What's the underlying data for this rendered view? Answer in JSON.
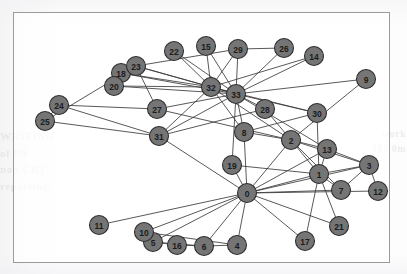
{
  "figure": {
    "frame": {
      "border_color": "#9a9a9a",
      "background_color": "#ffffff"
    },
    "node_style": {
      "fill_color": "#757575",
      "stroke_color": "#2f2f2f",
      "label_color": "#1c1c1c",
      "radius": 9.5
    },
    "edge_style": {
      "color": "#3b3b3b",
      "width": 0.85
    }
  },
  "background_bleed": {
    "left_text": "WRITING\nof EV\nnon CBT\nreporting",
    "right_text": "work\n180 0m"
  },
  "chart_data": {
    "type": "graph",
    "xlabel": "",
    "ylabel": "",
    "directed": false,
    "node_count": 34,
    "edge_count": 78,
    "layout": "spring",
    "nodes": [
      {
        "id": "0",
        "label": "0",
        "x": 233,
        "y": 180
      },
      {
        "id": "1",
        "label": "1",
        "x": 305,
        "y": 161
      },
      {
        "id": "2",
        "label": "2",
        "x": 277,
        "y": 127
      },
      {
        "id": "3",
        "label": "3",
        "x": 355,
        "y": 152
      },
      {
        "id": "4",
        "label": "4",
        "x": 223,
        "y": 232
      },
      {
        "id": "5",
        "label": "5",
        "x": 139,
        "y": 229
      },
      {
        "id": "6",
        "label": "6",
        "x": 190,
        "y": 233
      },
      {
        "id": "7",
        "label": "7",
        "x": 327,
        "y": 177
      },
      {
        "id": "8",
        "label": "8",
        "x": 230,
        "y": 119
      },
      {
        "id": "9",
        "label": "9",
        "x": 352,
        "y": 66
      },
      {
        "id": "10",
        "label": "10",
        "x": 130,
        "y": 219
      },
      {
        "id": "11",
        "label": "11",
        "x": 85,
        "y": 212
      },
      {
        "id": "12",
        "label": "12",
        "x": 364,
        "y": 178
      },
      {
        "id": "13",
        "label": "13",
        "x": 313,
        "y": 136
      },
      {
        "id": "14",
        "label": "14",
        "x": 300,
        "y": 43
      },
      {
        "id": "15",
        "label": "15",
        "x": 192,
        "y": 33
      },
      {
        "id": "16",
        "label": "16",
        "x": 163,
        "y": 232
      },
      {
        "id": "17",
        "label": "17",
        "x": 291,
        "y": 228
      },
      {
        "id": "18",
        "label": "18",
        "x": 107,
        "y": 60
      },
      {
        "id": "19",
        "label": "19",
        "x": 218,
        "y": 152
      },
      {
        "id": "20",
        "label": "20",
        "x": 100,
        "y": 73
      },
      {
        "id": "21",
        "label": "21",
        "x": 325,
        "y": 213
      },
      {
        "id": "22",
        "label": "22",
        "x": 160,
        "y": 38
      },
      {
        "id": "23",
        "label": "23",
        "x": 122,
        "y": 53
      },
      {
        "id": "24",
        "label": "24",
        "x": 45,
        "y": 92
      },
      {
        "id": "25",
        "label": "25",
        "x": 31,
        "y": 108
      },
      {
        "id": "26",
        "label": "26",
        "x": 270,
        "y": 35
      },
      {
        "id": "27",
        "label": "27",
        "x": 143,
        "y": 96
      },
      {
        "id": "28",
        "label": "28",
        "x": 251,
        "y": 96
      },
      {
        "id": "29",
        "label": "29",
        "x": 224,
        "y": 36
      },
      {
        "id": "30",
        "label": "30",
        "x": 303,
        "y": 100
      },
      {
        "id": "31",
        "label": "31",
        "x": 145,
        "y": 123
      },
      {
        "id": "32",
        "label": "32",
        "x": 197,
        "y": 74
      },
      {
        "id": "33",
        "label": "33",
        "x": 222,
        "y": 81
      }
    ],
    "edges": [
      [
        "0",
        "1"
      ],
      [
        "0",
        "2"
      ],
      [
        "0",
        "3"
      ],
      [
        "0",
        "4"
      ],
      [
        "0",
        "5"
      ],
      [
        "0",
        "6"
      ],
      [
        "0",
        "7"
      ],
      [
        "0",
        "8"
      ],
      [
        "0",
        "10"
      ],
      [
        "0",
        "11"
      ],
      [
        "0",
        "12"
      ],
      [
        "0",
        "13"
      ],
      [
        "0",
        "17"
      ],
      [
        "0",
        "19"
      ],
      [
        "0",
        "21"
      ],
      [
        "0",
        "31"
      ],
      [
        "1",
        "2"
      ],
      [
        "1",
        "3"
      ],
      [
        "1",
        "7"
      ],
      [
        "1",
        "13"
      ],
      [
        "1",
        "17"
      ],
      [
        "1",
        "19"
      ],
      [
        "1",
        "21"
      ],
      [
        "1",
        "30"
      ],
      [
        "2",
        "3"
      ],
      [
        "2",
        "7"
      ],
      [
        "2",
        "8"
      ],
      [
        "2",
        "9"
      ],
      [
        "2",
        "13"
      ],
      [
        "2",
        "27"
      ],
      [
        "2",
        "28"
      ],
      [
        "2",
        "32"
      ],
      [
        "3",
        "7"
      ],
      [
        "3",
        "12"
      ],
      [
        "3",
        "13"
      ],
      [
        "4",
        "6"
      ],
      [
        "4",
        "10"
      ],
      [
        "5",
        "6"
      ],
      [
        "5",
        "10"
      ],
      [
        "5",
        "16"
      ],
      [
        "6",
        "16"
      ],
      [
        "8",
        "30"
      ],
      [
        "8",
        "32"
      ],
      [
        "8",
        "33"
      ],
      [
        "9",
        "33"
      ],
      [
        "13",
        "33"
      ],
      [
        "14",
        "32"
      ],
      [
        "14",
        "33"
      ],
      [
        "15",
        "32"
      ],
      [
        "15",
        "33"
      ],
      [
        "18",
        "32"
      ],
      [
        "18",
        "33"
      ],
      [
        "19",
        "33"
      ],
      [
        "20",
        "32"
      ],
      [
        "20",
        "33"
      ],
      [
        "22",
        "32"
      ],
      [
        "22",
        "33"
      ],
      [
        "23",
        "25"
      ],
      [
        "23",
        "27"
      ],
      [
        "23",
        "29"
      ],
      [
        "23",
        "32"
      ],
      [
        "23",
        "33"
      ],
      [
        "24",
        "25"
      ],
      [
        "24",
        "27"
      ],
      [
        "24",
        "31"
      ],
      [
        "25",
        "31"
      ],
      [
        "26",
        "29"
      ],
      [
        "26",
        "33"
      ],
      [
        "27",
        "33"
      ],
      [
        "28",
        "31"
      ],
      [
        "28",
        "33"
      ],
      [
        "29",
        "32"
      ],
      [
        "29",
        "33"
      ],
      [
        "30",
        "32"
      ],
      [
        "30",
        "33"
      ],
      [
        "31",
        "32"
      ],
      [
        "31",
        "33"
      ],
      [
        "32",
        "33"
      ]
    ]
  }
}
